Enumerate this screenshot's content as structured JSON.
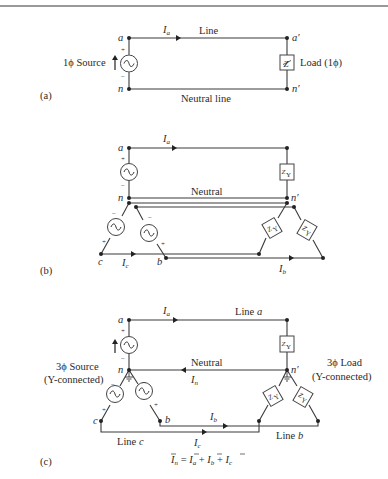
{
  "figure": {
    "panel_a": {
      "tag": "(a)",
      "node_a": "a",
      "node_n": "n",
      "node_a_prime": "a′",
      "node_n_prime": "n′",
      "current": "I",
      "current_sub": "a",
      "line_label": "Line",
      "neutral_label": "Neutral line",
      "source_label": "1ϕ Source",
      "load_label": "Load (1ϕ)",
      "load_symbol": "Z",
      "plus": "+",
      "minus": "−"
    },
    "panel_b": {
      "tag": "(b)",
      "node_a": "a",
      "node_n": "n",
      "node_n_prime": "n′",
      "node_b": "b",
      "node_c": "c",
      "current_a": "I",
      "current_a_sub": "a",
      "current_b": "I",
      "current_b_sub": "b",
      "current_c": "I",
      "current_c_sub": "c",
      "neutral_label": "Neutral",
      "load_symbol": "Z",
      "load_sub": "Y",
      "plus": "+",
      "minus": "−"
    },
    "panel_c": {
      "tag": "(c)",
      "node_a": "a",
      "node_n": "n",
      "node_n_prime": "n′",
      "node_b": "b",
      "node_c": "c",
      "current_a": "I",
      "current_a_sub": "a",
      "current_b": "I",
      "current_b_sub": "b",
      "current_c": "I",
      "current_c_sub": "c",
      "current_n": "I",
      "current_n_sub": "n",
      "line_a_label": "Line",
      "line_a_letter": "a",
      "line_b_label": "Line",
      "line_b_letter": "b",
      "line_c_label": "Line",
      "line_c_letter": "c",
      "neutral_label": "Neutral",
      "source_label_1": "3ϕ Source",
      "source_label_2": "(Y-connected)",
      "load_label_1": "3ϕ Load",
      "load_label_2": "(Y-connected)",
      "load_symbol": "Z",
      "load_sub": "Y",
      "equation": "Īₙ = Īₐ + Ī_b + Ī_c",
      "eq_parts": {
        "lhs": "I",
        "lhs_sub": "n",
        "eq": " = ",
        "t1": "I",
        "t1_sub": "a",
        "plus1": " + ",
        "t2": "I",
        "t2_sub": "b",
        "plus2": " + ",
        "t3": "I",
        "t3_sub": "c"
      },
      "plus": "+",
      "minus": "−"
    }
  }
}
